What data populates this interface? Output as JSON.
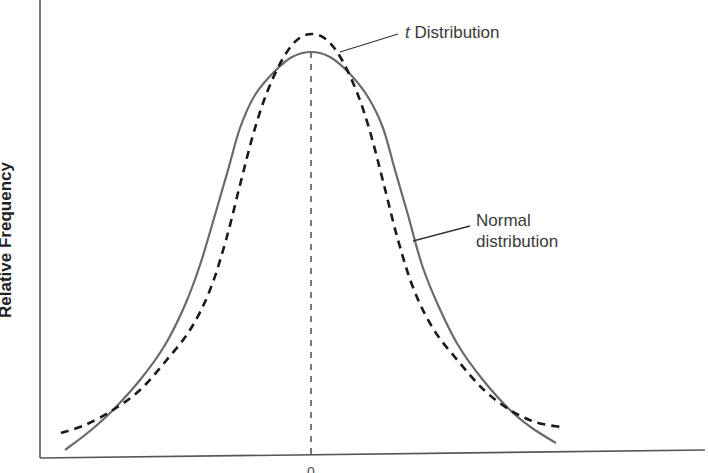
{
  "chart_data": {
    "type": "line",
    "title": "",
    "xlabel": "",
    "ylabel": "Relative Frequency",
    "grid": false,
    "legend": "annotations",
    "x_center_tick": "0",
    "series": [
      {
        "name": "Normal distribution",
        "style": "solid",
        "color": "#6a6a6a",
        "points_px": [
          [
            65,
            450
          ],
          [
            90,
            431
          ],
          [
            113,
            410
          ],
          [
            140,
            380
          ],
          [
            165,
            345
          ],
          [
            185,
            305
          ],
          [
            200,
            265
          ],
          [
            215,
            215
          ],
          [
            228,
            170
          ],
          [
            240,
            128
          ],
          [
            255,
            95
          ],
          [
            274,
            72
          ],
          [
            292,
            57
          ],
          [
            311,
            52
          ],
          [
            330,
            57
          ],
          [
            350,
            74
          ],
          [
            368,
            97
          ],
          [
            383,
            128
          ],
          [
            395,
            170
          ],
          [
            408,
            215
          ],
          [
            422,
            265
          ],
          [
            438,
            305
          ],
          [
            458,
            345
          ],
          [
            483,
            380
          ],
          [
            510,
            410
          ],
          [
            532,
            428
          ],
          [
            556,
            443
          ]
        ]
      },
      {
        "name": "t Distribution",
        "style": "dashed",
        "color": "#1a1a1a",
        "points_px": [
          [
            61,
            433
          ],
          [
            85,
            425
          ],
          [
            113,
            410
          ],
          [
            140,
            390
          ],
          [
            165,
            362
          ],
          [
            190,
            330
          ],
          [
            210,
            290
          ],
          [
            226,
            240
          ],
          [
            240,
            185
          ],
          [
            253,
            135
          ],
          [
            266,
            95
          ],
          [
            282,
            60
          ],
          [
            297,
            40
          ],
          [
            312,
            34
          ],
          [
            327,
            40
          ],
          [
            342,
            60
          ],
          [
            358,
            95
          ],
          [
            371,
            135
          ],
          [
            384,
            185
          ],
          [
            398,
            240
          ],
          [
            414,
            290
          ],
          [
            434,
            330
          ],
          [
            459,
            362
          ],
          [
            484,
            390
          ],
          [
            510,
            410
          ],
          [
            535,
            422
          ],
          [
            560,
            427
          ]
        ]
      }
    ],
    "center_line": {
      "x": 311,
      "y_top": 52,
      "y_bottom": 458
    },
    "annotations": [
      {
        "text_italic": "t",
        "text": " Distribution",
        "target": "t Distribution"
      },
      {
        "line1": "Normal",
        "line2": "distribution",
        "target": "Normal distribution"
      }
    ]
  }
}
